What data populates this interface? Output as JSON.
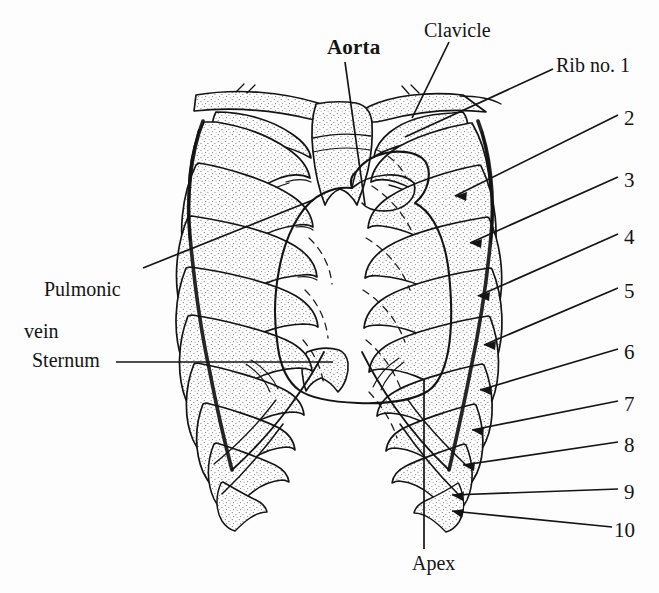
{
  "figure": {
    "background_color": "#fdfdfd",
    "ink_color": "#141414",
    "stipple_color": "#6a6a6a"
  },
  "labels": {
    "aorta": "Aorta",
    "clavicle": "Clavicle",
    "rib_no_1": "Rib no. 1",
    "pulmonic_line1": "Pulmonic",
    "pulmonic_line2": "vein",
    "sternum": "Sternum",
    "apex": "Apex"
  },
  "rib_numbers": [
    {
      "label": "2",
      "x": 624,
      "y": 106
    },
    {
      "label": "3",
      "x": 624,
      "y": 168
    },
    {
      "label": "4",
      "x": 624,
      "y": 225
    },
    {
      "label": "5",
      "x": 624,
      "y": 279
    },
    {
      "label": "6",
      "x": 624,
      "y": 340
    },
    {
      "label": "7",
      "x": 624,
      "y": 392
    },
    {
      "label": "8",
      "x": 624,
      "y": 433
    },
    {
      "label": "9",
      "x": 624,
      "y": 480
    },
    {
      "label": "10",
      "x": 614,
      "y": 518
    }
  ]
}
